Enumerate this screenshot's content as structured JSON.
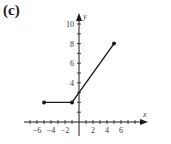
{
  "panel_label": "(c)",
  "chart_data": {
    "type": "line",
    "title": "",
    "xlabel": "x",
    "ylabel": "y",
    "xlim": [
      -8,
      8
    ],
    "ylim": [
      -1,
      11
    ],
    "xticks": [
      -6,
      -4,
      -2,
      2,
      4,
      6
    ],
    "yticks": [
      2,
      4,
      6,
      8,
      10
    ],
    "xtick_labels": [
      "−6",
      "−4",
      "−2",
      "2",
      "4",
      "6"
    ],
    "ytick_labels": [
      "4",
      "6",
      "8",
      "10"
    ],
    "grid": false,
    "series": [
      {
        "name": "f(x)",
        "x": [
          -5,
          -1,
          5
        ],
        "y": [
          2,
          2,
          8
        ],
        "endpoints": "closed"
      }
    ],
    "color": "#1a1a1a"
  }
}
